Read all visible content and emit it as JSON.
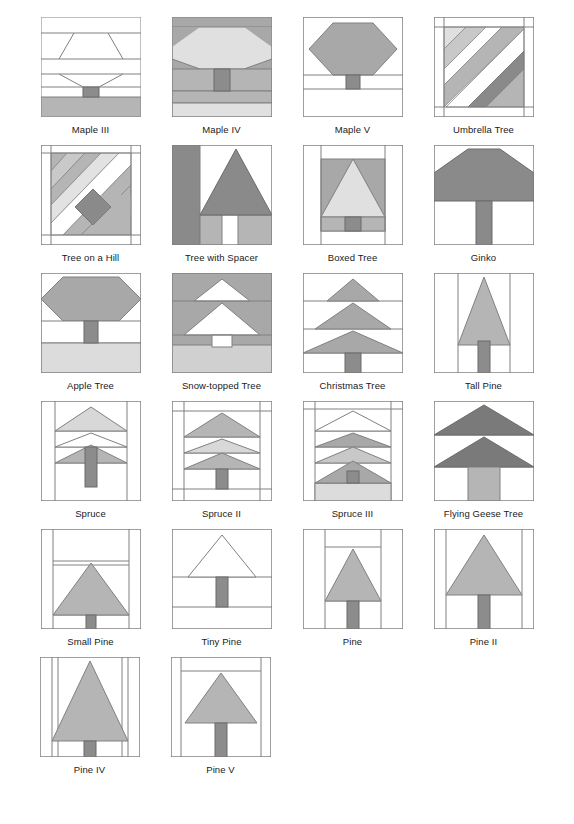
{
  "page": {
    "background": "#ffffff",
    "columns": 4,
    "total_blocks": 22
  },
  "palette": {
    "outline": "#808080",
    "dark_outline": "#6b6b6b",
    "white": "#ffffff",
    "light_gray": "#e0e0e0",
    "pale_gray": "#d8d8d8",
    "mid_gray": "#b5b5b5",
    "medium_gray": "#a8a8a8",
    "dark_gray": "#8a8a8a",
    "darker_gray": "#7a7a7a",
    "trunk_gray": "#8c8c8c",
    "text": "#1a1a1a"
  },
  "rows": [
    {
      "index": 1,
      "blocks": [
        {
          "id": "maple-3",
          "label": "Maple III"
        },
        {
          "id": "maple-4",
          "label": "Maple IV"
        },
        {
          "id": "maple-5",
          "label": "Maple V"
        },
        {
          "id": "umbrella-tree",
          "label": "Umbrella Tree"
        }
      ]
    },
    {
      "index": 2,
      "blocks": [
        {
          "id": "tree-on-a-hill",
          "label": "Tree on a Hill"
        },
        {
          "id": "tree-with-spacer",
          "label": "Tree with Spacer"
        },
        {
          "id": "boxed-tree",
          "label": "Boxed Tree"
        },
        {
          "id": "ginko",
          "label": "Ginko"
        }
      ]
    },
    {
      "index": 3,
      "blocks": [
        {
          "id": "apple-tree",
          "label": "Apple Tree"
        },
        {
          "id": "snow-topped-tree",
          "label": "Snow-topped Tree"
        },
        {
          "id": "christmas-tree",
          "label": "Christmas Tree"
        },
        {
          "id": "tall-pine",
          "label": "Tall Pine"
        }
      ]
    },
    {
      "index": 4,
      "blocks": [
        {
          "id": "spruce",
          "label": "Spruce"
        },
        {
          "id": "spruce-2",
          "label": "Spruce II"
        },
        {
          "id": "spruce-3",
          "label": "Spruce III"
        },
        {
          "id": "flying-geese-tree",
          "label": "Flying Geese Tree"
        }
      ]
    },
    {
      "index": 5,
      "blocks": [
        {
          "id": "small-pine",
          "label": "Small Pine"
        },
        {
          "id": "tiny-pine",
          "label": "Tiny Pine"
        },
        {
          "id": "pine",
          "label": "Pine"
        },
        {
          "id": "pine-2",
          "label": "Pine II"
        }
      ]
    },
    {
      "index": 6,
      "blocks": [
        {
          "id": "pine-4",
          "label": "Pine IV"
        },
        {
          "id": "pine-5",
          "label": "Pine V"
        }
      ]
    }
  ]
}
